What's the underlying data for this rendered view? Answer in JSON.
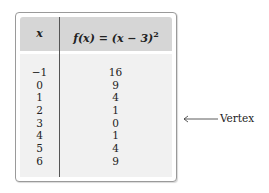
{
  "table": {
    "header": {
      "x_label": "x",
      "f_label": "f(x) = (x − 3)",
      "f_exponent": "2"
    },
    "rows": [
      {
        "x": "−1",
        "f": "16"
      },
      {
        "x": "0",
        "f": "9"
      },
      {
        "x": "1",
        "f": "4"
      },
      {
        "x": "2",
        "f": "1"
      },
      {
        "x": "3",
        "f": "0"
      },
      {
        "x": "4",
        "f": "1"
      },
      {
        "x": "5",
        "f": "4"
      },
      {
        "x": "6",
        "f": "9"
      }
    ]
  },
  "annotation": {
    "label": "Vertex",
    "points_to_row": 4,
    "icon": "left-arrow-icon"
  },
  "colors": {
    "header_bg": "#d6d6d6",
    "body_bg": "#f1f1f1",
    "border": "#9a9a9a",
    "text": "#222222"
  }
}
